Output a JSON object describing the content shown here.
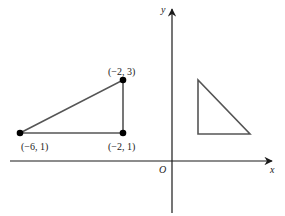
{
  "diagram": {
    "axes": {
      "x_label": "x",
      "y_label": "y",
      "origin_label": "O",
      "color": "#1a1a1a"
    },
    "triangle_left": {
      "points": [
        {
          "label": "(−6, 1)",
          "x": -6,
          "y": 1
        },
        {
          "label": "(−2, 1)",
          "x": -2,
          "y": 1
        },
        {
          "label": "(−2, 3)",
          "x": -2,
          "y": 3
        }
      ],
      "stroke": "#555555",
      "point_color": "#000000"
    },
    "triangle_right": {
      "description": "unlabeled right triangle in first quadrant",
      "stroke": "#555555"
    }
  }
}
